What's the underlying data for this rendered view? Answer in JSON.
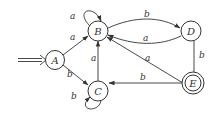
{
  "diagram": {
    "type": "finite-automaton",
    "start_state": "A",
    "states": [
      {
        "id": "A",
        "label": "A",
        "accepting": false
      },
      {
        "id": "B",
        "label": "B",
        "accepting": false
      },
      {
        "id": "C",
        "label": "C",
        "accepting": false
      },
      {
        "id": "D",
        "label": "D",
        "accepting": false
      },
      {
        "id": "E",
        "label": "E",
        "accepting": true
      }
    ],
    "transitions": [
      {
        "from": "A",
        "to": "B",
        "label": "a"
      },
      {
        "from": "A",
        "to": "C",
        "label": "b"
      },
      {
        "from": "B",
        "to": "B",
        "label": "a"
      },
      {
        "from": "C",
        "to": "C",
        "label": "b"
      },
      {
        "from": "C",
        "to": "B",
        "label": "a"
      },
      {
        "from": "B",
        "to": "D",
        "label": "b"
      },
      {
        "from": "D",
        "to": "B",
        "label": "a"
      },
      {
        "from": "D",
        "to": "E",
        "label": "b"
      },
      {
        "from": "E",
        "to": "B",
        "label": "a"
      },
      {
        "from": "E",
        "to": "C",
        "label": "b"
      }
    ]
  }
}
